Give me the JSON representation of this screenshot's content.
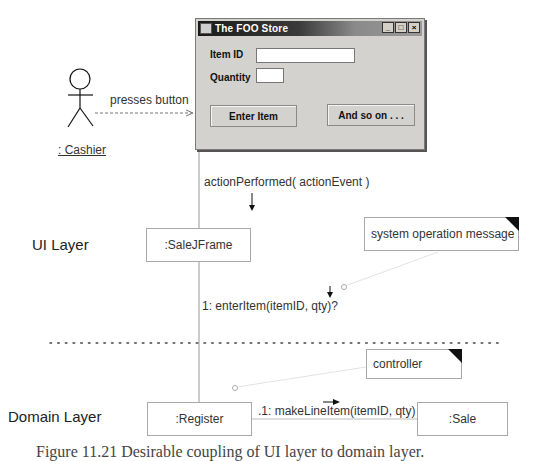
{
  "window": {
    "title": "The FOO Store",
    "controls": [
      "minimize",
      "maximize",
      "close"
    ],
    "item_id_label": "Item ID",
    "item_id_value": "",
    "quantity_label": "Quantity",
    "quantity_value": "",
    "enter_item_button": "Enter Item",
    "and_so_on_button": "And so on . . ."
  },
  "actor": {
    "name": ": Cashier",
    "action_label": "presses button"
  },
  "messages": {
    "action_performed": "actionPerformed( actionEvent )",
    "enter_item": "1: enterItem(itemID, qty)?",
    "make_line_item": ".1: makeLineItem(itemID, qty)"
  },
  "objects": {
    "sale_jframe": ":SaleJFrame",
    "register": ":Register",
    "sale": ":Sale"
  },
  "notes": {
    "system_operation": "system operation message",
    "controller": "controller"
  },
  "layers": {
    "ui": "UI Layer",
    "domain": "Domain Layer"
  },
  "caption": "Figure 11.21 Desirable coupling of UI layer to domain layer."
}
